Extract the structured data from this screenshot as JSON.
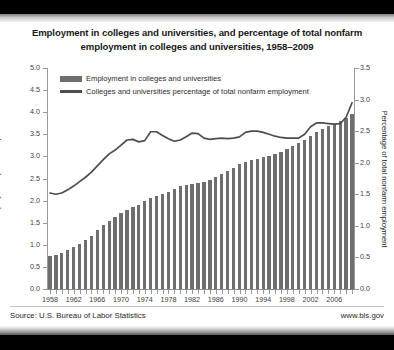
{
  "chart_data": {
    "type": "bar",
    "title": "Employment in colleges and universities, and percentage of total nonfarm employment in colleges and universities, 1958–2009",
    "title_line1": "Employment in colleges and universities, and percentage of total nonfarm",
    "title_line2": "employment in colleges and universities, 1958–2009",
    "xlabel": "",
    "ylabel": "Employment (in millions)",
    "ylabel_right": "Percentage of total nonfarm employment",
    "ylim": [
      0.0,
      5.0
    ],
    "ylim_right": [
      0.0,
      3.5
    ],
    "yticks": [
      "0.0",
      "0.5",
      "1.0",
      "1.5",
      "2.0",
      "2.5",
      "3.0",
      "3.5",
      "4.0",
      "4.5",
      "5.0"
    ],
    "yticks_right": [
      "0.0",
      "0.5",
      "1.0",
      "1.5",
      "2.0",
      "2.5",
      "3.0",
      "3.5"
    ],
    "grid": false,
    "legend_position": "upper-left",
    "x": [
      1958,
      1959,
      1960,
      1961,
      1962,
      1963,
      1964,
      1965,
      1966,
      1967,
      1968,
      1969,
      1970,
      1971,
      1972,
      1973,
      1974,
      1975,
      1976,
      1977,
      1978,
      1979,
      1980,
      1981,
      1982,
      1983,
      1984,
      1985,
      1986,
      1987,
      1988,
      1989,
      1990,
      1991,
      1992,
      1993,
      1994,
      1995,
      1996,
      1997,
      1998,
      1999,
      2000,
      2001,
      2002,
      2003,
      2004,
      2005,
      2006,
      2007,
      2008,
      2009
    ],
    "xticks": [
      "1958",
      "1962",
      "1966",
      "1970",
      "1974",
      "1978",
      "1982",
      "1986",
      "1990",
      "1994",
      "1998",
      "2002",
      "2006"
    ],
    "series": [
      {
        "name": "Employment in colleges and universities",
        "axis": "left",
        "type": "bar",
        "color": "#6e6e6e",
        "values": [
          0.75,
          0.78,
          0.82,
          0.88,
          0.95,
          1.02,
          1.1,
          1.2,
          1.33,
          1.45,
          1.55,
          1.64,
          1.72,
          1.79,
          1.85,
          1.91,
          1.98,
          2.05,
          2.1,
          2.14,
          2.2,
          2.26,
          2.32,
          2.36,
          2.38,
          2.4,
          2.43,
          2.47,
          2.53,
          2.6,
          2.67,
          2.74,
          2.82,
          2.88,
          2.92,
          2.95,
          2.99,
          3.02,
          3.06,
          3.11,
          3.17,
          3.23,
          3.3,
          3.38,
          3.47,
          3.55,
          3.62,
          3.68,
          3.74,
          3.8,
          3.88,
          3.95
        ]
      },
      {
        "name": "Colleges and universities percentage of total nonfarm employment",
        "axis": "right",
        "type": "line",
        "color": "#4d4d4d",
        "values": [
          1.52,
          1.5,
          1.52,
          1.57,
          1.63,
          1.7,
          1.77,
          1.85,
          1.95,
          2.05,
          2.14,
          2.2,
          2.28,
          2.36,
          2.37,
          2.33,
          2.35,
          2.49,
          2.49,
          2.43,
          2.38,
          2.34,
          2.36,
          2.41,
          2.47,
          2.46,
          2.39,
          2.37,
          2.38,
          2.39,
          2.38,
          2.39,
          2.41,
          2.48,
          2.5,
          2.5,
          2.48,
          2.45,
          2.42,
          2.4,
          2.39,
          2.39,
          2.39,
          2.45,
          2.57,
          2.63,
          2.63,
          2.62,
          2.61,
          2.62,
          2.72,
          2.95
        ]
      }
    ]
  },
  "legend": {
    "items": [
      {
        "label": "Employment in colleges and universities",
        "marker": "bar-swatch"
      },
      {
        "label": "Colleges and universities percentage of total nonfarm employment",
        "marker": "line-swatch"
      }
    ]
  },
  "footer": {
    "source": "Source: U.S. Bureau of Labor Statistics",
    "website": "www.bls.gov"
  },
  "colors": {
    "bar": "#6e6e6e",
    "line": "#4d4d4d",
    "axis": "#9a9a9a",
    "text": "#1a1a1a",
    "background": "#ffffff",
    "frame": "#000000"
  }
}
